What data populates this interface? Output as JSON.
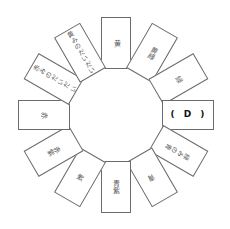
{
  "diagram": {
    "title": "",
    "type": "color-wheel",
    "segments": [
      {
        "index": 0,
        "label": "黄",
        "angle_deg": 0,
        "is_blank": false
      },
      {
        "index": 1,
        "label": "黄緑",
        "angle_deg": 30,
        "is_blank": false
      },
      {
        "index": 2,
        "label": "緑",
        "angle_deg": 60,
        "is_blank": false
      },
      {
        "index": 3,
        "label": "( D )",
        "angle_deg": 90,
        "is_blank": true
      },
      {
        "index": 4,
        "label": "緑みの青",
        "angle_deg": 120,
        "is_blank": false
      },
      {
        "index": 5,
        "label": "青",
        "angle_deg": 150,
        "is_blank": false
      },
      {
        "index": 6,
        "label": "青紫",
        "angle_deg": 180,
        "is_blank": false
      },
      {
        "index": 7,
        "label": "紫",
        "angle_deg": 210,
        "is_blank": false
      },
      {
        "index": 8,
        "label": "赤紫",
        "angle_deg": 240,
        "is_blank": false
      },
      {
        "index": 9,
        "label": "赤",
        "angle_deg": 270,
        "is_blank": false
      },
      {
        "index": 10,
        "label": "赤みのだいだい",
        "angle_deg": 300,
        "is_blank": false
      },
      {
        "index": 11,
        "label": "黄みのだいだい",
        "angle_deg": 330,
        "is_blank": false
      }
    ],
    "colors": {
      "border": "#6b6b6b",
      "text": "#555555",
      "answer_text": "#111111",
      "background": "#ffffff"
    }
  }
}
